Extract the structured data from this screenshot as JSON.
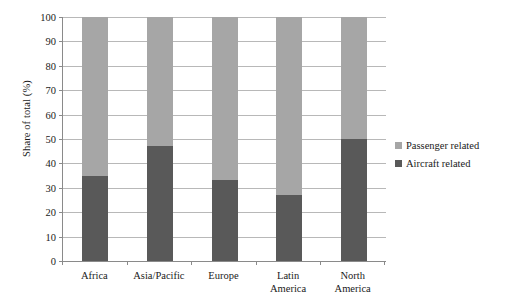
{
  "chart_data": {
    "type": "bar",
    "subtype": "stacked-100-percent",
    "title": "",
    "subtitle": "",
    "xlabel": "",
    "ylabel": "Share of total (%)",
    "ylim": [
      0,
      100
    ],
    "ytick_step": 10,
    "yticks": [
      "100",
      "90",
      "80",
      "70",
      "60",
      "50",
      "40",
      "30",
      "20",
      "10",
      "0"
    ],
    "ytick_values": [
      100,
      90,
      80,
      70,
      60,
      50,
      40,
      30,
      20,
      10,
      0
    ],
    "grid": true,
    "grid_axis": "y",
    "legend_position": "right",
    "categories": [
      "Africa",
      "Asia/Pacific",
      "Europe",
      "Latin America",
      "North America"
    ],
    "category_lines": [
      [
        "Africa"
      ],
      [
        "Asia/Pacific"
      ],
      [
        "Europe"
      ],
      [
        "Latin",
        "America"
      ],
      [
        "North",
        "America"
      ]
    ],
    "series": [
      {
        "name": "Passenger related",
        "color": "#a6a6a6",
        "values": [
          65,
          53,
          67,
          73,
          50
        ]
      },
      {
        "name": "Aircraft related",
        "color": "#595959",
        "values": [
          35,
          47,
          33,
          27,
          50
        ]
      }
    ],
    "legend_order": [
      "Passenger related",
      "Aircraft related"
    ]
  },
  "colors": {
    "passenger_related": "#a6a6a6",
    "aircraft_related": "#595959",
    "gridline": "#b8b8b8",
    "axis": "#8a8a8a",
    "text": "#1a1a1a",
    "background": "#ffffff"
  }
}
